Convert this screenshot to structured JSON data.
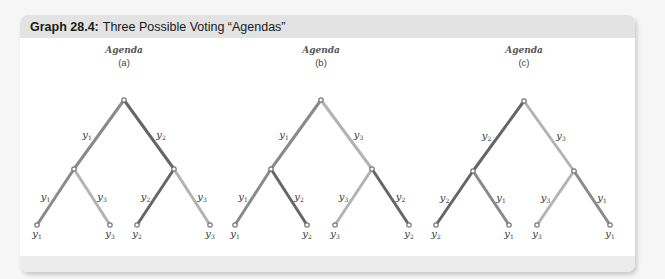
{
  "header": {
    "label": "Graph 28.4:",
    "title": "Three Possible Voting “Agendas”"
  },
  "colors": {
    "y1": "#8a8a8a",
    "y2": "#666666",
    "y3": "#b3b3b3",
    "header_bg": "#e3e3e3",
    "node": "#777777"
  },
  "agendas": [
    {
      "title": "Agenda",
      "subtitle": "(a)",
      "root": [
        124,
        100
      ],
      "mid_left": [
        74,
        169
      ],
      "mid_right": [
        174,
        169
      ],
      "leaves_x": [
        37,
        110,
        137,
        210
      ],
      "top_branches": [
        "y1",
        "y2"
      ],
      "left_branches": [
        "y1",
        "y3"
      ],
      "right_branches": [
        "y2",
        "y3"
      ],
      "leaf_labels": [
        "y1",
        "y3",
        "y2",
        "y3"
      ]
    },
    {
      "title": "Agenda",
      "subtitle": "(b)",
      "root": [
        321,
        100
      ],
      "mid_left": [
        271,
        169
      ],
      "mid_right": [
        372,
        169
      ],
      "leaves_x": [
        235,
        307,
        335,
        409
      ],
      "top_branches": [
        "y1",
        "y3"
      ],
      "left_branches": [
        "y1",
        "y2"
      ],
      "right_branches": [
        "y3",
        "y2"
      ],
      "leaf_labels": [
        "y1",
        "y2",
        "y3",
        "y2"
      ]
    },
    {
      "title": "Agenda",
      "subtitle": "(c)",
      "root": [
        524,
        101
      ],
      "mid_left": [
        473,
        171
      ],
      "mid_right": [
        574,
        171
      ],
      "leaves_x": [
        436,
        509,
        537,
        610
      ],
      "top_branches": [
        "y2",
        "y3"
      ],
      "left_branches": [
        "y2",
        "y1"
      ],
      "right_branches": [
        "y3",
        "y1"
      ],
      "leaf_labels": [
        "y2",
        "y1",
        "y3",
        "y1"
      ]
    }
  ],
  "leaf_y": 225
}
